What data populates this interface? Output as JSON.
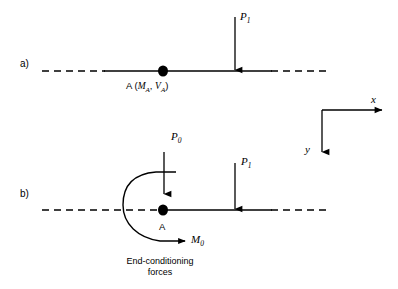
{
  "figure": {
    "background_color": "#ffffff",
    "stroke_color": "#000000",
    "width": 398,
    "height": 289
  },
  "panels": [
    {
      "id": "a",
      "label": "a)",
      "node_point_label": "A",
      "node_reactions_label": "(M_A, V_A)",
      "node_label_text": "A (MA, VA)",
      "node_label_parts": {
        "name": "A",
        "open_paren": " (",
        "moment": "M",
        "moment_sub": "A",
        "comma": ", ",
        "shear": "V",
        "shear_sub": "A",
        "close_paren": ")"
      },
      "loads": [
        {
          "name": "P",
          "subscript": "1",
          "label": "P1",
          "direction": "down"
        }
      ]
    },
    {
      "id": "b",
      "label": "b)",
      "node_point_label": "A",
      "loads": [
        {
          "name": "P",
          "subscript": "0",
          "label": "P0",
          "direction": "down"
        },
        {
          "name": "P",
          "subscript": "1",
          "label": "P1",
          "direction": "down"
        }
      ],
      "moment": {
        "name": "M",
        "subscript": "0",
        "label": "M0",
        "direction": "curved-clockwise"
      },
      "caption_line_1": "End-conditioning",
      "caption_line_2": "forces"
    }
  ],
  "axes": {
    "x_label": "x",
    "y_label": "y",
    "x_direction": "right",
    "y_direction": "down"
  }
}
